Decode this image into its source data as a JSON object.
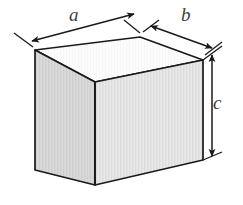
{
  "figure": {
    "name": "rectangular-box-dimensions-diagram",
    "type": "technical-line-drawing",
    "background_color": "#ffffff",
    "solid": {
      "name": "rectangular-box",
      "shape": "cuboid",
      "outline_color": "#1a1a1a",
      "faces": {
        "top": {
          "name": "top-face",
          "fill": "#fbfbfb"
        },
        "front_left": {
          "name": "front-left-face",
          "fill": "#d6d6d6"
        },
        "front_right": {
          "name": "front-right-face",
          "fill": "#e4e4e4"
        }
      }
    },
    "dimensions": [
      {
        "id": "a",
        "label": "a",
        "name": "dimension-label-a",
        "edge": "top-left-edge",
        "arrow_style": "double-headed",
        "orientation": "up-right-diagonal",
        "color": "#1a1a1a"
      },
      {
        "id": "b",
        "label": "b",
        "name": "dimension-label-b",
        "edge": "top-right-edge",
        "arrow_style": "double-headed",
        "orientation": "down-right-diagonal",
        "color": "#1a1a1a"
      },
      {
        "id": "c",
        "label": "c",
        "name": "dimension-label-c",
        "edge": "right-vertical-edge",
        "arrow_style": "double-headed",
        "orientation": "vertical",
        "color": "#1a1a1a"
      }
    ]
  }
}
